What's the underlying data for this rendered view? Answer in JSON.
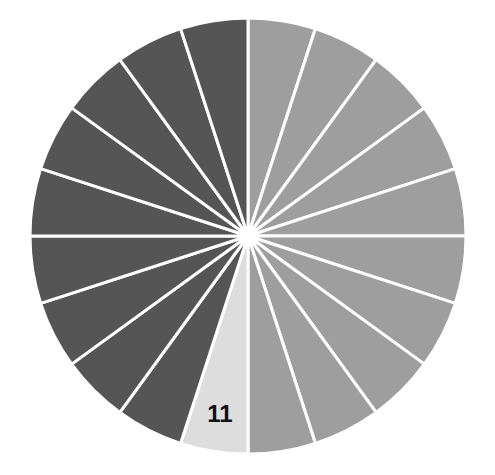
{
  "chart_data": {
    "type": "pie",
    "title": "",
    "slice_count": 20,
    "start_angle_deg": 0,
    "direction": "clockwise",
    "categories": [
      "1",
      "2",
      "3",
      "4",
      "5",
      "6",
      "7",
      "8",
      "9",
      "10",
      "11",
      "12",
      "13",
      "14",
      "15",
      "16",
      "17",
      "18",
      "19",
      "20"
    ],
    "values": [
      1,
      1,
      1,
      1,
      1,
      1,
      1,
      1,
      1,
      1,
      1,
      1,
      1,
      1,
      1,
      1,
      1,
      1,
      1,
      1
    ],
    "highlighted_slice": "11",
    "visible_labels": [
      {
        "slice": "11",
        "text": "11"
      }
    ],
    "legend": null
  },
  "colors": {
    "group_a": "#9e9e9e",
    "highlight": "#dddddd",
    "group_b": "#555555",
    "separator": "#ffffff",
    "label": "#111111"
  },
  "slice_groups": [
    "a",
    "a",
    "a",
    "a",
    "a",
    "a",
    "a",
    "a",
    "a",
    "a",
    "h",
    "b",
    "b",
    "b",
    "b",
    "b",
    "b",
    "b",
    "b",
    "b"
  ],
  "label_text": "11"
}
